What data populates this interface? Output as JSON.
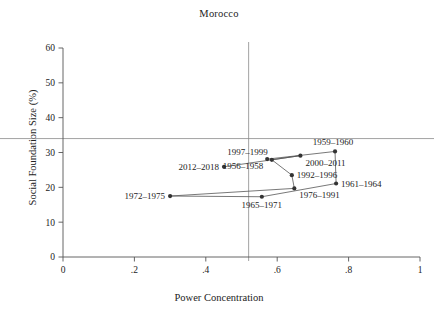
{
  "chart_data": {
    "type": "scatter",
    "title": "Morocco",
    "xlabel": "Power Concentration",
    "ylabel": "Social Foundation Size (%)",
    "xlim": [
      0,
      1
    ],
    "ylim": [
      0,
      62
    ],
    "xticks": [
      "0",
      ".2",
      ".4",
      ".6",
      ".8",
      "1"
    ],
    "xtick_values": [
      0,
      0.2,
      0.4,
      0.6,
      0.8,
      1
    ],
    "yticks": [
      "0",
      "10",
      "20",
      "30",
      "40",
      "50",
      "60"
    ],
    "ytick_values": [
      0,
      10,
      20,
      30,
      40,
      50,
      60
    ],
    "grid": false,
    "legend": "none",
    "connected": true,
    "marker": "filled-circle",
    "marker_color": "#333333",
    "line_color": "#555555",
    "reference_lines": [
      {
        "name": "horizontal-mean-line",
        "orientation": "horizontal",
        "y": 34.0
      },
      {
        "name": "vertical-mean-line",
        "orientation": "vertical",
        "x": 0.52
      }
    ],
    "points": [
      {
        "label": "1956–1958",
        "x": 0.572,
        "y": 28.1,
        "label_pos": "below-left"
      },
      {
        "label": "1959–1960",
        "x": 0.762,
        "y": 30.3,
        "label_pos": "above-right"
      },
      {
        "label": "1961–1964",
        "x": 0.765,
        "y": 21.1,
        "label_pos": "right"
      },
      {
        "label": "1965–1971",
        "x": 0.557,
        "y": 17.3,
        "label_pos": "below"
      },
      {
        "label": "1972–1975",
        "x": 0.3,
        "y": 17.5,
        "label_pos": "left"
      },
      {
        "label": "1976–1991",
        "x": 0.648,
        "y": 19.7,
        "label_pos": "below-right"
      },
      {
        "label": "1992–1996",
        "x": 0.641,
        "y": 23.5,
        "label_pos": "right"
      },
      {
        "label": "1997–1999",
        "x": 0.585,
        "y": 27.9,
        "label_pos": "above-left"
      },
      {
        "label": "2000–2011",
        "x": 0.665,
        "y": 29.1,
        "label_pos": "below-right"
      },
      {
        "label": "2012–2018",
        "x": 0.451,
        "y": 25.9,
        "label_pos": "left"
      }
    ],
    "path_order": [
      "1956–1958",
      "1959–1960",
      "1961–1964",
      "1965–1971",
      "1972–1975",
      "1976–1991",
      "1992–1996",
      "1997–1999",
      "2000–2011",
      "2012–2018"
    ]
  },
  "colors": {
    "axis": "#555555",
    "marker": "#333333",
    "line": "#555555",
    "reference": "#8a8a8a",
    "text": "#222222",
    "background": "#ffffff"
  }
}
